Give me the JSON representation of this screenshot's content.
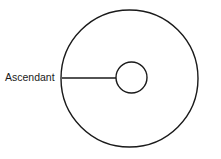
{
  "figure": {
    "background_color": "#ffffff",
    "stroke_color": "#1a1a1a",
    "labels": {
      "ascendant": "Ascendant"
    }
  },
  "chart_data": {
    "type": "diagram",
    "title": "",
    "shapes": [
      {
        "name": "outer-circle",
        "kind": "circle",
        "cx": 129.5,
        "cy": 78.5,
        "r": 68.5,
        "fill": "none",
        "stroke": "#1a1a1a"
      },
      {
        "name": "inner-circle",
        "kind": "circle",
        "cx": 131.5,
        "cy": 77.5,
        "r": 15.5,
        "fill": "none",
        "stroke": "#1a1a1a"
      },
      {
        "name": "ascendant-leader-line",
        "kind": "line",
        "x1": 62,
        "y1": 78,
        "x2": 116,
        "y2": 78,
        "stroke": "#1a1a1a"
      }
    ],
    "annotations": [
      {
        "name": "ascendant-label",
        "text": "Ascendant",
        "x": 5,
        "y": 78,
        "anchor": "start",
        "points_to": "outer-circle-left-edge"
      }
    ]
  }
}
